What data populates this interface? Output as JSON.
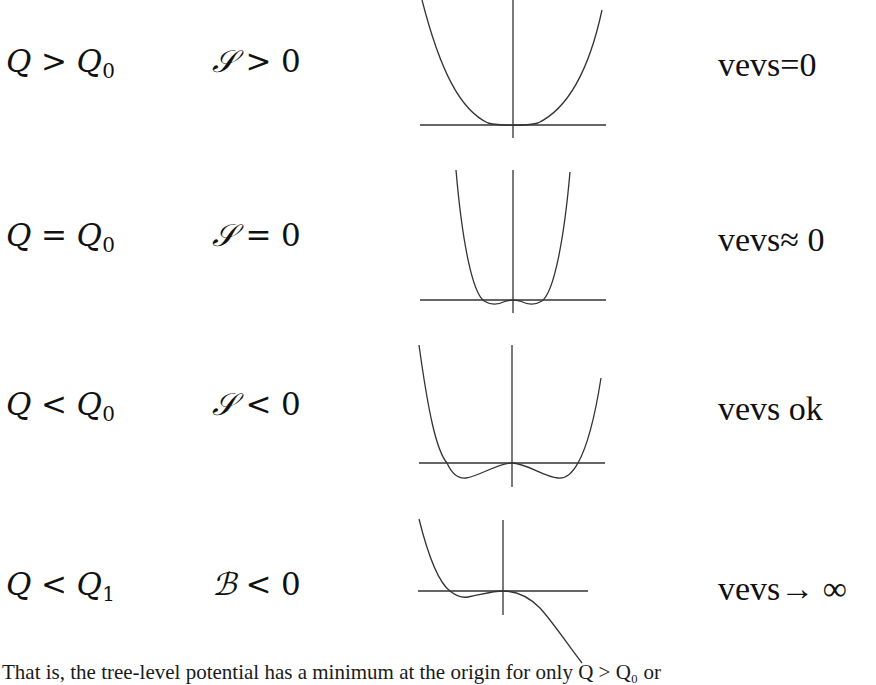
{
  "rows": [
    {
      "q_condition": {
        "lhs": "Q",
        "op": ">",
        "rhs": "Q",
        "rhs_sub": "0"
      },
      "coef_condition": {
        "symbol": "𝒮",
        "op": ">",
        "value": "0"
      },
      "plot": "single-minimum-at-origin",
      "vev_label": "vevs=0"
    },
    {
      "q_condition": {
        "lhs": "Q",
        "op": "=",
        "rhs": "Q",
        "rhs_sub": "0"
      },
      "coef_condition": {
        "symbol": "𝒮",
        "op": "=",
        "value": "0"
      },
      "plot": "shallow-double-well",
      "vev_label": "vevs≈ 0"
    },
    {
      "q_condition": {
        "lhs": "Q",
        "op": "<",
        "rhs": "Q",
        "rhs_sub": "0"
      },
      "coef_condition": {
        "symbol": "𝒮",
        "op": "<",
        "value": "0"
      },
      "plot": "double-well",
      "vev_label": "vevs ok"
    },
    {
      "q_condition": {
        "lhs": "Q",
        "op": "<",
        "rhs": "Q",
        "rhs_sub": "1"
      },
      "coef_condition": {
        "symbol": "ℬ",
        "op": "<",
        "value": "0"
      },
      "plot": "unbounded-below",
      "vev_label": "vevs→ ∞"
    }
  ],
  "footer_text": "That is, the tree-level potential has a minimum at the origin for only Q > Q₀ or"
}
